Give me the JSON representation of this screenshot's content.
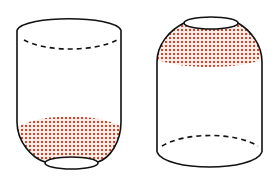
{
  "diagram": {
    "description": "Two cup-shaped cylindrical containers with dotted shaded regions",
    "colors": {
      "stroke": "#111111",
      "dot": "#b3503c",
      "dot_bg": "#fbe9e4",
      "background": "#ffffff"
    },
    "figures": [
      {
        "id": "left",
        "orientation": "open-top, tapered bottom",
        "shaded_region": "bottom taper",
        "dashed_edge": "top back rim"
      },
      {
        "id": "right",
        "orientation": "tapered top, flat bottom",
        "shaded_region": "top taper",
        "dashed_edge": "bottom back rim"
      }
    ]
  }
}
